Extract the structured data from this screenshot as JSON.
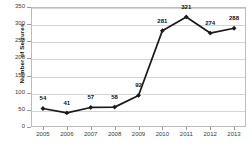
{
  "chart_data": {
    "type": "line",
    "title": "",
    "xlabel": "",
    "ylabel": "Number of Seizures",
    "categories": [
      "2005",
      "2006",
      "2007",
      "2008",
      "2009",
      "2010",
      "2011",
      "2012",
      "2013"
    ],
    "values": [
      54,
      41,
      57,
      58,
      92,
      281,
      321,
      274,
      288
    ],
    "point_labels": [
      "54",
      "41",
      "57",
      "58",
      "92",
      "281",
      "321",
      "274",
      "288"
    ],
    "ylim": [
      0,
      350
    ],
    "yticks": [
      0,
      50,
      100,
      150,
      200,
      250,
      300,
      350
    ],
    "ytick_labels": [
      "0",
      "50",
      "100",
      "150",
      "200",
      "250",
      "300",
      "350"
    ],
    "grid": true,
    "legend": "none",
    "series_color": "#1a1a1a",
    "grid_color": "#d4d4d4",
    "marker": "diamond"
  }
}
